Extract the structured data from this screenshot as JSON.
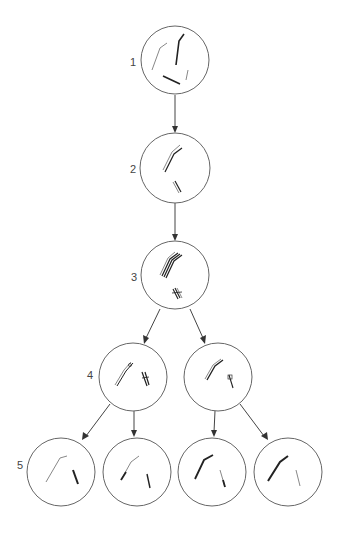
{
  "diagram": {
    "type": "lineage-tree",
    "stages": [
      {
        "label": "1",
        "cells": 1
      },
      {
        "label": "2",
        "cells": 1
      },
      {
        "label": "3",
        "cells": 1
      },
      {
        "label": "4",
        "cells": 2
      },
      {
        "label": "5",
        "cells": 4
      }
    ],
    "colors": {
      "cell_outline": "#666666",
      "arrow": "#444444",
      "chromosome_dark": "#222222",
      "chromosome_light": "#888888"
    }
  }
}
